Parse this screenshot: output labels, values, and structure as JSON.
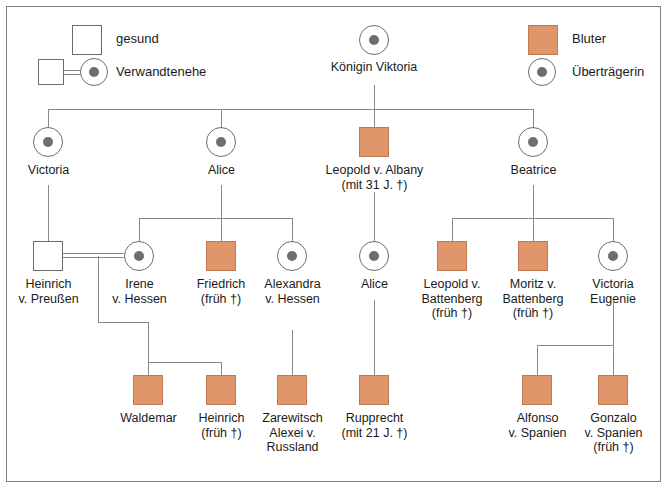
{
  "colors": {
    "affected": "#e0956b",
    "affected_border": "#c07a52",
    "line": "#8a8a8a",
    "text": "#1b1b1b"
  },
  "legend": {
    "left": [
      {
        "symbol": "empty-square",
        "label": "gesund"
      },
      {
        "symbol": "square-circle-link",
        "label": "Verwandtenehe"
      }
    ],
    "right": [
      {
        "symbol": "filled-square",
        "label": "Bluter"
      },
      {
        "symbol": "dotted-circle",
        "label": "Überträgerin"
      }
    ]
  },
  "generations": [
    {
      "roman": "I",
      "people": [
        {
          "id": "viktoria",
          "name": "Königin Viktoria",
          "note": "",
          "sex": "female",
          "status": "carrier"
        }
      ]
    },
    {
      "roman": "II",
      "people": [
        {
          "id": "victoria",
          "name": "Victoria",
          "note": "",
          "sex": "female",
          "status": "carrier"
        },
        {
          "id": "alice2",
          "name": "Alice",
          "note": "",
          "sex": "female",
          "status": "carrier"
        },
        {
          "id": "leopold_albany",
          "name": "Leopold v. Albany",
          "note": "(mit 31 J. †)",
          "sex": "male",
          "status": "affected"
        },
        {
          "id": "beatrice",
          "name": "Beatrice",
          "note": "",
          "sex": "female",
          "status": "carrier"
        }
      ]
    },
    {
      "roman": "III",
      "people": [
        {
          "id": "heinrich_preussen",
          "name": "Heinrich\nv. Preußen",
          "note": "",
          "sex": "male",
          "status": "healthy"
        },
        {
          "id": "irene_hessen",
          "name": "Irene\nv. Hessen",
          "note": "",
          "sex": "female",
          "status": "carrier"
        },
        {
          "id": "friedrich",
          "name": "Friedrich",
          "note": "(früh †)",
          "sex": "male",
          "status": "affected"
        },
        {
          "id": "alexandra_hessen",
          "name": "Alexandra\nv. Hessen",
          "note": "",
          "sex": "female",
          "status": "carrier"
        },
        {
          "id": "alice3",
          "name": "Alice",
          "note": "",
          "sex": "female",
          "status": "carrier"
        },
        {
          "id": "leopold_battenberg",
          "name": "Leopold v.\nBattenberg",
          "note": "(früh †)",
          "sex": "male",
          "status": "affected"
        },
        {
          "id": "moritz_battenberg",
          "name": "Moritz v.\nBattenberg",
          "note": "(früh †)",
          "sex": "male",
          "status": "affected"
        },
        {
          "id": "victoria_eugenie",
          "name": "Victoria\nEugenie",
          "note": "",
          "sex": "female",
          "status": "carrier"
        }
      ]
    },
    {
      "roman": "IV",
      "people": [
        {
          "id": "waldemar",
          "name": "Waldemar",
          "note": "",
          "sex": "male",
          "status": "affected"
        },
        {
          "id": "heinrich4",
          "name": "Heinrich",
          "note": "(früh †)",
          "sex": "male",
          "status": "affected"
        },
        {
          "id": "alexei",
          "name": "Zarewitsch\nAlexei v.\nRussland",
          "note": "",
          "sex": "male",
          "status": "affected"
        },
        {
          "id": "rupprecht",
          "name": "Rupprecht",
          "note": "(mit 21 J. †)",
          "sex": "male",
          "status": "affected"
        },
        {
          "id": "alfonso",
          "name": "Alfonso\nv. Spanien",
          "note": "",
          "sex": "male",
          "status": "affected"
        },
        {
          "id": "gonzalo",
          "name": "Gonzalo\nv. Spanien",
          "note": "(früh †)",
          "sex": "male",
          "status": "affected"
        }
      ]
    }
  ]
}
